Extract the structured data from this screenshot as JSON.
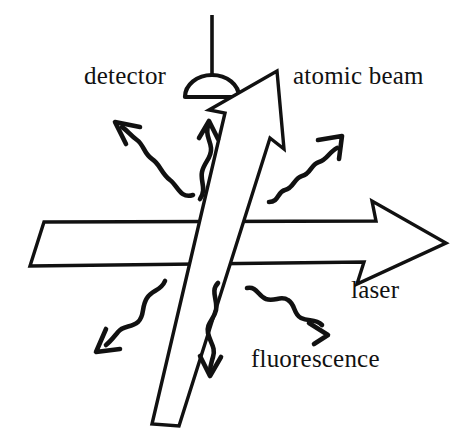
{
  "figure": {
    "type": "schematic-diagram",
    "background_color": "#ffffff",
    "ink_color": "#111111",
    "width": 469,
    "height": 441
  },
  "labels": {
    "detector": "detector",
    "atomic_beam": "atomic beam",
    "laser": "laser",
    "fluorescence": "fluorescence"
  },
  "elements": {
    "detector_icon": {
      "name": "detector-icon",
      "shape": "semicircular dome with vertical stem",
      "stem_top": [
        212,
        14
      ],
      "dome_center": [
        212,
        96
      ]
    },
    "atomic_beam_arrow": {
      "name": "atomic-beam-arrow",
      "style": "hollow outline arrow",
      "direction": "up-right",
      "tail": [
        148,
        424
      ],
      "tip": [
        277,
        70
      ]
    },
    "laser_arrow": {
      "name": "laser-arrow",
      "style": "hollow outline arrow",
      "direction": "right",
      "tail": [
        26,
        239
      ],
      "tip": [
        444,
        242
      ]
    },
    "fluorescence_squiggles": [
      {
        "name": "squiggle-up-left",
        "direction": "up-left"
      },
      {
        "name": "squiggle-up",
        "direction": "up"
      },
      {
        "name": "squiggle-up-right",
        "direction": "up-right"
      },
      {
        "name": "squiggle-down-left",
        "direction": "down-left"
      },
      {
        "name": "squiggle-down",
        "direction": "down"
      },
      {
        "name": "squiggle-down-right",
        "direction": "down-right"
      }
    ]
  }
}
